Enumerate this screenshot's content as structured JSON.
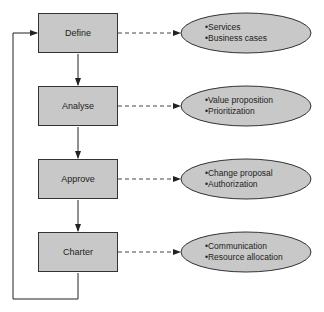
{
  "diagram": {
    "type": "process-flow",
    "colors": {
      "fill": "#c8c8c8",
      "stroke": "#333333",
      "background": "#ffffff"
    },
    "steps": [
      {
        "label": "Define",
        "details": [
          "Services",
          "Business cases"
        ]
      },
      {
        "label": "Analyse",
        "details": [
          "Value proposition",
          "Prioritization"
        ]
      },
      {
        "label": "Approve",
        "details": [
          "Change proposal",
          "Authorization"
        ]
      },
      {
        "label": "Charter",
        "details": [
          "Communication",
          "Resource allocation"
        ]
      }
    ],
    "connections": [
      {
        "from": "Define",
        "to": "Analyse",
        "style": "solid-arrow"
      },
      {
        "from": "Analyse",
        "to": "Approve",
        "style": "solid-arrow"
      },
      {
        "from": "Approve",
        "to": "Charter",
        "style": "solid-arrow"
      },
      {
        "from": "Charter",
        "to": "Define",
        "style": "solid-loop-arrow"
      },
      {
        "from": "Define",
        "to": "Define details",
        "style": "dashed-arrow"
      },
      {
        "from": "Analyse",
        "to": "Analyse details",
        "style": "dashed-arrow"
      },
      {
        "from": "Approve",
        "to": "Approve details",
        "style": "dashed-arrow"
      },
      {
        "from": "Charter",
        "to": "Charter details",
        "style": "dashed-arrow"
      }
    ]
  }
}
